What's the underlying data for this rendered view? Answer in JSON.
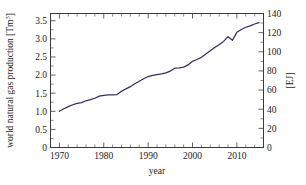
{
  "chart_data": {
    "type": "line",
    "title": "",
    "xlabel": "year",
    "ylabel": "world natural gas production [Tm³]",
    "ylabel_right": "[EJ]",
    "xlim": [
      1968,
      2016
    ],
    "ylim": [
      0,
      3.7
    ],
    "ylim_right": [
      0,
      140
    ],
    "grid": false,
    "legend": null,
    "x_ticks": [
      1970,
      1980,
      1990,
      2000,
      2010
    ],
    "x_tick_labels": [
      "1970",
      "1980",
      "1990",
      "2000",
      "2010"
    ],
    "x_minor_tick_step": 2,
    "y_ticks": [
      0,
      0.5,
      1.0,
      1.5,
      2.0,
      2.5,
      3.0,
      3.5
    ],
    "y_tick_labels": [
      "0",
      "0.5",
      "1.0",
      "1.5",
      "2.0",
      "2.5",
      "3.0",
      "3.5"
    ],
    "y_right_ticks": [
      0,
      20,
      40,
      60,
      80,
      100,
      120,
      140
    ],
    "y_right_tick_labels": [
      "0",
      "20",
      "40",
      "60",
      "80",
      "100",
      "120",
      "140"
    ],
    "line_color": "#3b2a63",
    "series": [
      {
        "name": "world natural gas production",
        "units": "Tm3",
        "x": [
          1970,
          1971,
          1972,
          1973,
          1974,
          1975,
          1976,
          1977,
          1978,
          1979,
          1980,
          1981,
          1982,
          1983,
          1984,
          1985,
          1986,
          1987,
          1988,
          1989,
          1990,
          1991,
          1992,
          1993,
          1994,
          1995,
          1996,
          1997,
          1998,
          1999,
          2000,
          2001,
          2002,
          2003,
          2004,
          2005,
          2006,
          2007,
          2008,
          2009,
          2010,
          2011,
          2012,
          2013,
          2014,
          2015
        ],
        "values": [
          1.0,
          1.07,
          1.13,
          1.18,
          1.22,
          1.24,
          1.29,
          1.32,
          1.36,
          1.42,
          1.44,
          1.45,
          1.45,
          1.46,
          1.55,
          1.62,
          1.68,
          1.76,
          1.83,
          1.9,
          1.96,
          1.99,
          2.01,
          2.03,
          2.06,
          2.11,
          2.19,
          2.2,
          2.22,
          2.28,
          2.38,
          2.43,
          2.49,
          2.58,
          2.67,
          2.76,
          2.84,
          2.93,
          3.06,
          2.96,
          3.18,
          3.26,
          3.32,
          3.36,
          3.41,
          3.45
        ]
      }
    ]
  }
}
